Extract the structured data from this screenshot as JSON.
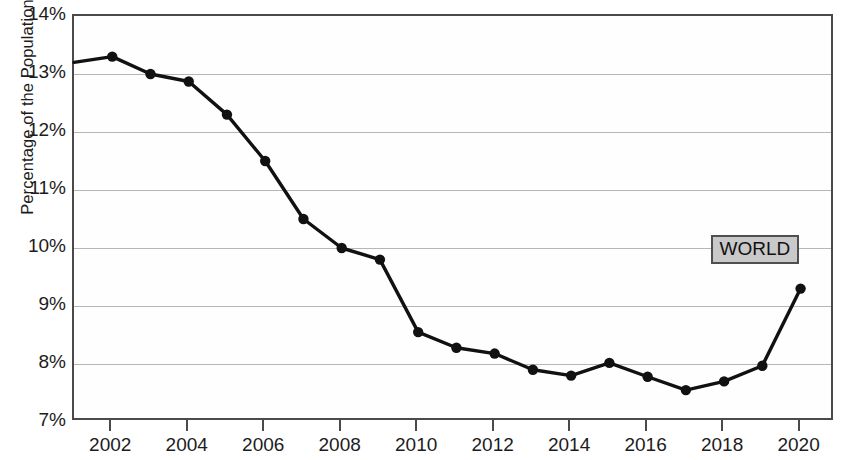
{
  "chart_data": {
    "type": "line",
    "title": "",
    "xlabel": "",
    "ylabel": "Percentage of the Population",
    "series_label": "WORLD",
    "x": [
      2001,
      2002,
      2003,
      2004,
      2005,
      2006,
      2007,
      2008,
      2009,
      2010,
      2011,
      2012,
      2013,
      2014,
      2015,
      2016,
      2017,
      2018,
      2019,
      2020
    ],
    "values": [
      13.2,
      13.3,
      13.0,
      12.87,
      12.3,
      11.5,
      10.5,
      10.0,
      9.8,
      8.55,
      8.28,
      8.18,
      7.9,
      7.8,
      8.02,
      7.78,
      7.55,
      7.7,
      7.97,
      9.3
    ],
    "xlim": [
      2001,
      2020.9
    ],
    "ylim": [
      7,
      14
    ],
    "ytick_values": [
      14,
      13,
      12,
      11,
      10,
      9,
      8,
      7
    ],
    "ytick_labels": [
      "14%",
      "13%",
      "12%",
      "11%",
      "10%",
      "9%",
      "8%",
      "7%"
    ],
    "xtick_values": [
      2002,
      2004,
      2006,
      2008,
      2010,
      2012,
      2014,
      2016,
      2018,
      2020
    ],
    "xtick_labels": [
      "2002",
      "2004",
      "2006",
      "2008",
      "2010",
      "2012",
      "2014",
      "2016",
      "2018",
      "2020"
    ],
    "grid": "horizontal",
    "legend_position": "inline-annotation",
    "line_color": "#111111",
    "marker_color": "#111111",
    "gridline_color": "#b6b6b6",
    "axis_color": "#4a4a4a",
    "label_box_fill": "#c9c9c9",
    "label_box_border": "#4f4f4f",
    "background_color": "#ffffff"
  }
}
